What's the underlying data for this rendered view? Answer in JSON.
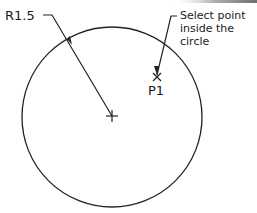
{
  "diagram": {
    "type": "cad-circle-selection",
    "radius_label": "R1.5",
    "point_label": "P1",
    "callout_lines": [
      "Select point",
      "inside the",
      "circle"
    ],
    "colors": {
      "line": "#222222",
      "background": "#ffffff",
      "top_band": "#8a8a8a"
    }
  }
}
